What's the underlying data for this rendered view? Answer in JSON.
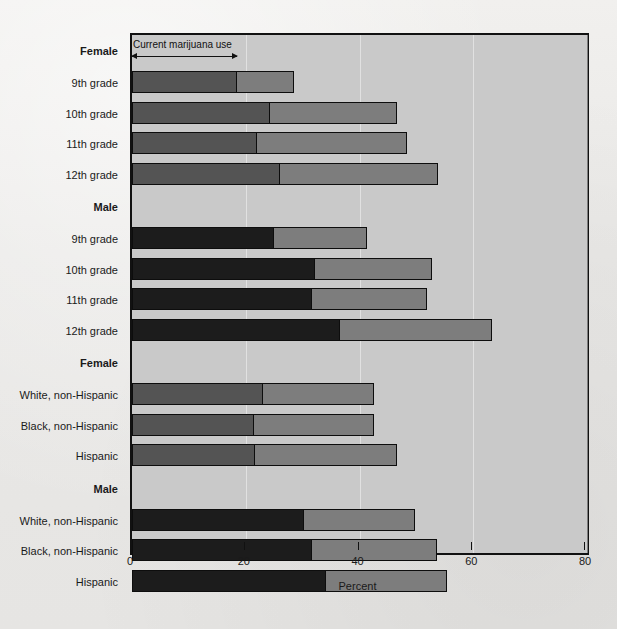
{
  "chart_data": {
    "type": "bar",
    "orientation": "horizontal",
    "stacked": true,
    "title": "",
    "xlabel": "Percent",
    "ylabel": "",
    "xlim": [
      0,
      80
    ],
    "xticks": [
      0,
      20,
      40,
      60,
      80
    ],
    "xticklabels": [
      "0",
      "20",
      "40",
      "60",
      "80"
    ],
    "grid": true,
    "annotation": {
      "text": "Current marijuana use",
      "arrow_from": 0,
      "arrow_to": 18.5
    },
    "series": [
      {
        "name": "Current marijuana use",
        "key": "current"
      },
      {
        "name": "Ever used marijuana",
        "key": "ever"
      }
    ],
    "groups": [
      {
        "label": "Female",
        "shade": "female",
        "categories": [
          "9th grade",
          "10th grade",
          "11th grade",
          "12th grade"
        ],
        "current": [
          18.5,
          24.2,
          22.0,
          26.0
        ],
        "total": [
          28.5,
          46.6,
          48.3,
          53.8
        ]
      },
      {
        "label": "Male",
        "shade": "male",
        "categories": [
          "9th grade",
          "10th grade",
          "11th grade",
          "12th grade"
        ],
        "current": [
          25.0,
          32.2,
          31.7,
          36.6
        ],
        "total": [
          41.3,
          52.7,
          51.9,
          63.3
        ]
      },
      {
        "label": "Female",
        "shade": "female",
        "categories": [
          "White, non-Hispanic",
          "Black, non-Hispanic",
          "Hispanic"
        ],
        "current": [
          23.0,
          21.4,
          21.6
        ],
        "total": [
          42.5,
          42.5,
          46.6
        ]
      },
      {
        "label": "Male",
        "shade": "male",
        "categories": [
          "White, non-Hispanic",
          "Black, non-Hispanic",
          "Hispanic"
        ],
        "current": [
          30.2,
          31.6,
          34.1
        ],
        "total": [
          49.7,
          53.6,
          55.4
        ]
      }
    ]
  },
  "colors": {
    "current_female": "#545454",
    "current_male": "#1c1c1c",
    "ever": "#7d7d7d",
    "plot_background": "#c9c9c9",
    "page_background": "#ebebeb",
    "axis": "#111111"
  }
}
